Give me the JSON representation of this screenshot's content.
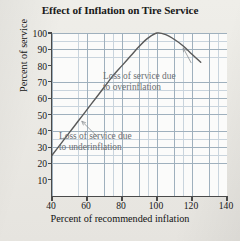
{
  "chart_data": {
    "type": "line",
    "title": "Effect of Inflation on Tire Service",
    "xlabel": "Percent of recommended inflation",
    "ylabel": "Percent of service",
    "xlim": [
      40,
      140
    ],
    "ylim": [
      0,
      100
    ],
    "xticks": [
      40,
      60,
      80,
      100,
      120,
      140
    ],
    "yticks": [
      10,
      20,
      30,
      40,
      50,
      60,
      70,
      80,
      90,
      100
    ],
    "grid": true,
    "grid_minor_step_x": 5,
    "grid_minor_step_y": 5,
    "legend": null,
    "series": [
      {
        "name": "Percent of service",
        "x": [
          40,
          45,
          50,
          55,
          60,
          65,
          70,
          75,
          80,
          85,
          90,
          95,
          100,
          105,
          110,
          115,
          120,
          125
        ],
        "y": [
          25,
          32,
          39,
          46,
          53,
          60,
          67,
          74,
          80,
          86,
          92,
          97,
          100,
          99,
          96,
          92,
          87,
          82
        ]
      }
    ],
    "annotations": [
      {
        "id": "overinflation",
        "text": "Loss of service due\nto overinflation",
        "points_to_x": 115,
        "points_to_y": 92
      },
      {
        "id": "underinflation",
        "text": "Loss of service due\nto underinflation",
        "points_to_x": 56,
        "points_to_y": 47
      }
    ]
  },
  "colors": {
    "page_background": "#e9e7e2",
    "plot_background": "#fbfbfa",
    "curve": "#595959",
    "axis": "#4a4a4a",
    "grid_major": "#9fb0bd",
    "grid_minor": "#c9d4dd",
    "annotation_text": "#6b6f73",
    "title_text": "#1a1a1a"
  }
}
